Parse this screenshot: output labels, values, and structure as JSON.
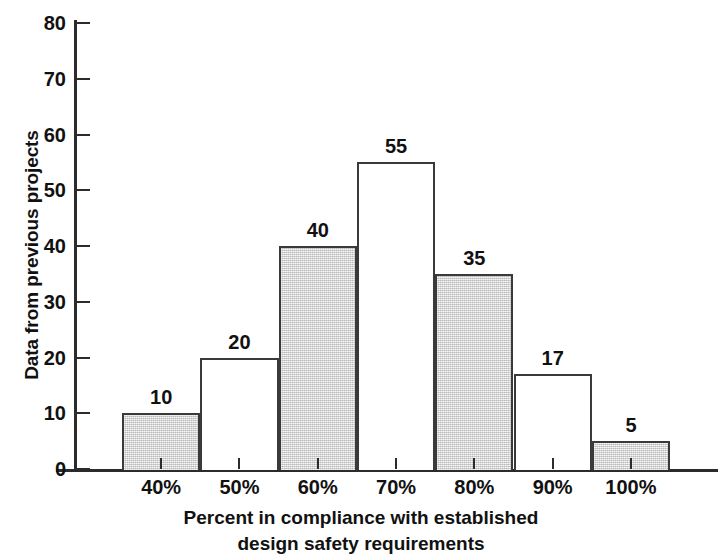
{
  "chart_data": {
    "type": "bar",
    "title": "",
    "xlabel": "Percent in compliance with established design safety requirements",
    "xlabel_line1": "Percent in compliance with established",
    "xlabel_line2": "design safety requirements",
    "ylabel": "Data from previous projects",
    "categories": [
      "40%",
      "50%",
      "60%",
      "70%",
      "80%",
      "90%",
      "100%"
    ],
    "values": [
      10,
      20,
      40,
      55,
      35,
      17,
      5
    ],
    "value_labels": [
      "10",
      "20",
      "40",
      "55",
      "35",
      "17",
      "5"
    ],
    "bar_fills": [
      "gray",
      "white",
      "gray",
      "white",
      "gray",
      "white",
      "gray"
    ],
    "ylim": [
      0,
      80
    ],
    "ytick_values": [
      0,
      10,
      20,
      30,
      40,
      50,
      60,
      70,
      80
    ],
    "ytick_labels": [
      "0",
      "10",
      "20",
      "30",
      "40",
      "50",
      "60",
      "70",
      "80"
    ],
    "grid": false,
    "legend": false,
    "colors": {
      "bar_gray": "#d6d6d6",
      "bar_white": "#ffffff",
      "bar_outline": "#3a3a3a",
      "axis": "#2b2b2b",
      "text": "#111111",
      "background": "#ffffff"
    }
  }
}
